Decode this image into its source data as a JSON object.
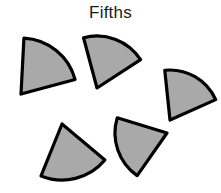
{
  "page": {
    "title": "Fifths",
    "background_color": "#ffffff",
    "width": 221,
    "height": 193
  },
  "figure": {
    "name": "fraction-sectors-figure",
    "shape_count": 5,
    "fill_color": "#a9a9a9",
    "stroke_color": "#000000",
    "stroke_width": 3.2,
    "sector_angle_degrees": 72,
    "sector_radius": 52,
    "shapes": [
      {
        "label": "sector-1",
        "center_x": 21,
        "center_y": 94,
        "radius": 56,
        "start_angle_degrees": -87,
        "sweep_degrees": 72
      },
      {
        "label": "sector-2",
        "center_x": 97,
        "center_y": 88,
        "radius": 52,
        "start_angle_degrees": -105,
        "sweep_degrees": 72
      },
      {
        "label": "sector-3",
        "center_x": 170,
        "center_y": 120,
        "radius": 50,
        "start_angle_degrees": -96,
        "sweep_degrees": 72
      },
      {
        "label": "sector-4",
        "center_x": 62,
        "center_y": 124,
        "radius": 56,
        "start_angle_degrees": 40,
        "sweep_degrees": 72
      },
      {
        "label": "sector-5",
        "center_x": 167,
        "center_y": 133,
        "radius": 52,
        "start_angle_degrees": 125,
        "sweep_degrees": 72
      }
    ]
  }
}
